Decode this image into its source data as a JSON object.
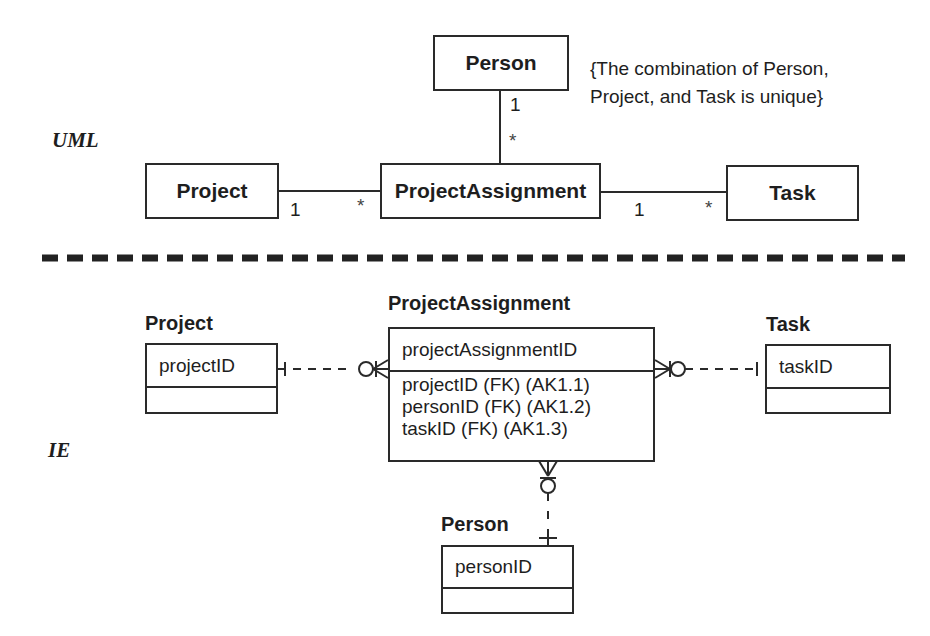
{
  "uml": {
    "section_label": "UML",
    "entities": {
      "person": "Person",
      "project": "Project",
      "project_assignment": "ProjectAssignment",
      "task": "Task"
    },
    "constraint_note": {
      "line1": "{The combination of Person,",
      "line2": "Project, and Task is unique}"
    },
    "associations": {
      "person_pa": {
        "person_end": "1",
        "pa_end": "*"
      },
      "project_pa": {
        "project_end": "1",
        "pa_end": "*"
      },
      "pa_task": {
        "pa_end": "1",
        "task_end": "*"
      }
    }
  },
  "ie": {
    "section_label": "IE",
    "entities": {
      "project": {
        "title": "Project",
        "pk": "projectID",
        "attributes": []
      },
      "project_assignment": {
        "title": "ProjectAssignment",
        "pk": "projectAssignmentID",
        "attributes": [
          "projectID (FK) (AK1.1)",
          "personID (FK) (AK1.2)",
          "taskID (FK) (AK1.3)"
        ]
      },
      "task": {
        "title": "Task",
        "pk": "taskID",
        "attributes": []
      },
      "person": {
        "title": "Person",
        "pk": "personID",
        "attributes": []
      }
    }
  },
  "colors": {
    "line": "#2a2a2a",
    "text": "#1e1e1e",
    "background": "#ffffff"
  }
}
